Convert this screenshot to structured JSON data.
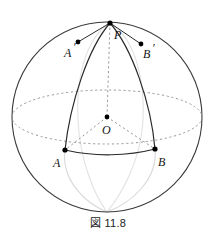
{
  "figure": {
    "caption": "図 11.8",
    "title": "Sphere with great-circle arcs from pole P to equator points A and B",
    "colors": {
      "outline": "#3a3a3a",
      "solid_arc": "#2b2b2b",
      "dashed_guide": "#8a8a8a",
      "faint_arc": "#dcdcdc",
      "point": "#000000",
      "label": "#141414",
      "background": "#ffffff"
    },
    "sphere": {
      "center": {
        "x": 107,
        "y": 117
      },
      "radius": 95,
      "equator_semi_minor": 27
    },
    "points": [
      {
        "name": "P",
        "label": "P",
        "x": 110,
        "y": 23,
        "label_x": 114,
        "label_y": 39
      },
      {
        "name": "A'",
        "label": "A",
        "prime": "′",
        "x": 78,
        "y": 42,
        "label_x": 64,
        "label_y": 57
      },
      {
        "name": "B'",
        "label": "B",
        "prime": "′",
        "x": 141,
        "y": 44,
        "label_x": 143,
        "label_y": 58
      },
      {
        "name": "O",
        "label": "O",
        "x": 107,
        "y": 117,
        "label_x": 103,
        "label_y": 133
      },
      {
        "name": "A",
        "label": "A",
        "x": 65,
        "y": 150,
        "label_x": 54,
        "label_y": 166
      },
      {
        "name": "B",
        "label": "B",
        "x": 155,
        "y": 149,
        "label_x": 158,
        "label_y": 165
      }
    ],
    "arcs": {
      "great_circle_PA": "M110,23 C88,48 70,104 65,150",
      "great_circle_PB": "M110,23 C132,48 151,103 155,149",
      "chord_AB": "M65,150 C95,157 128,156 155,149",
      "faint_PA_lower": "M65,150 C61,180 85,203 107,212",
      "faint_PB_lower": "M155,149 C158,180 131,203 107,212",
      "faint_meridian_left": "M110,23 C83,40 76,84 78,120 C80,162 95,196 107,212",
      "faint_meridian_right": "M110,23 C137,40 145,84 143,120 C141,162 120,196 107,212"
    },
    "dashed": {
      "axis_PO": "M110,23 L107,117",
      "radius_OA": "M107,117 L65,150",
      "radius_OB": "M107,117 L155,149",
      "equator": "ellipse cx=107 cy=117 rx=95 ry=27"
    }
  }
}
